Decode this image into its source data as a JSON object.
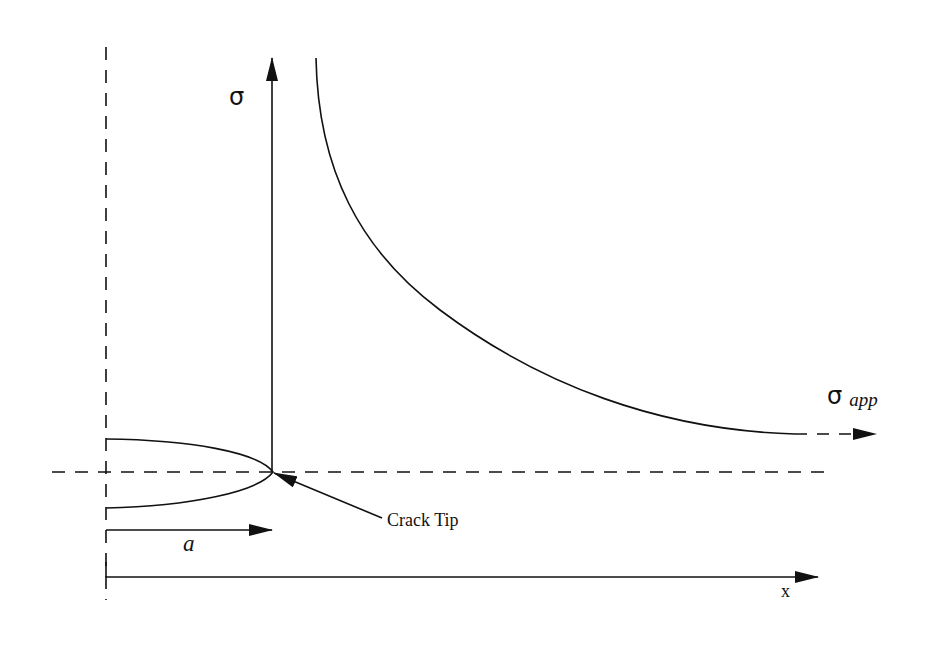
{
  "diagram": {
    "colors": {
      "ink": "#111111",
      "background": "#ffffff"
    },
    "labels": {
      "sigma_axis": "σ",
      "sigma_app_symbol": "σ",
      "sigma_app_subscript": "app",
      "crack_tip": "Crack Tip",
      "crack_length": "a",
      "x_axis": "x"
    },
    "elements": {
      "stress_axis": {
        "x": 272,
        "y_top": 58,
        "y_bottom": 472,
        "arrow": "up"
      },
      "x_axis": {
        "y": 577,
        "x_start": 106,
        "x_end": 818,
        "arrow": "right"
      },
      "crack_length_arrow": {
        "y": 530,
        "x_start": 106,
        "x_end": 272
      },
      "crack_centerline_dashed": {
        "x": 106,
        "y_top": 47,
        "y_bottom": 600
      },
      "crack_plane_dashed": {
        "y": 472,
        "x_start": 52,
        "x_end": 830
      },
      "crack_profile": {
        "tip": [
          273,
          472
        ],
        "upper_start": [
          106,
          439
        ],
        "lower_start": [
          106,
          508
        ]
      },
      "stress_curve": {
        "start": [
          316,
          58
        ],
        "end": [
          795,
          434
        ],
        "asymptote_y": 434
      },
      "applied_stress_arrow": {
        "y": 434,
        "x_start": 795,
        "x_end": 876,
        "style": "dashed"
      },
      "crack_tip_pointer": {
        "from": [
          382,
          518
        ],
        "to": [
          274,
          473
        ]
      }
    }
  }
}
